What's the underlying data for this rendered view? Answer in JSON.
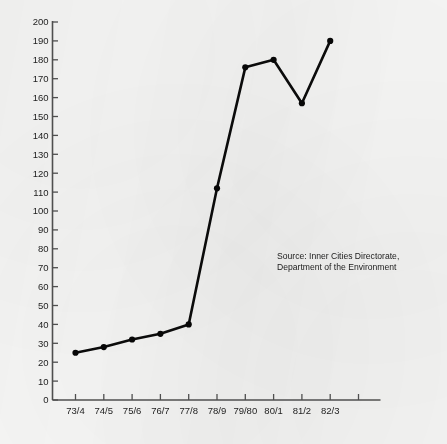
{
  "chart_data": {
    "type": "line",
    "title": "",
    "xlabel": "",
    "ylabel": "",
    "categories": [
      "73/4",
      "74/5",
      "75/6",
      "76/7",
      "77/8",
      "78/9",
      "79/80",
      "80/1",
      "81/2",
      "82/3"
    ],
    "values": [
      25,
      28,
      32,
      35,
      40,
      112,
      176,
      180,
      157,
      190
    ],
    "series": [
      {
        "name": "",
        "values": [
          25,
          28,
          32,
          35,
          40,
          112,
          176,
          180,
          157,
          190
        ]
      }
    ],
    "ylim": [
      0,
      200
    ],
    "ytick_step": 10,
    "ytick_labels": [
      "0",
      "10",
      "20",
      "30",
      "40",
      "50",
      "60",
      "70",
      "80",
      "90",
      "100",
      "110",
      "120",
      "130",
      "140",
      "150",
      "160",
      "170",
      "180",
      "190",
      "200"
    ],
    "grid": false,
    "legend": null,
    "markers": "filled-circle",
    "extra_unlabeled_xticks": 1,
    "annotations": [
      {
        "name": "source-credit",
        "text": "Source: Inner Cities Directorate,\nDepartment of the Environment"
      }
    ]
  },
  "colors": {
    "line": "#0b0b0b",
    "marker": "#070707",
    "axis": "#4f4f4f",
    "text": "#1d1d1d",
    "background": "#f6f6f5"
  }
}
